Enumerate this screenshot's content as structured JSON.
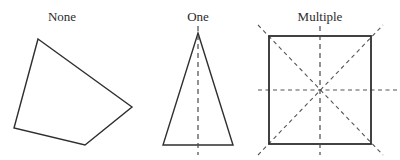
{
  "figure": {
    "background_color": "#ffffff",
    "stroke_color": "#2e2e2e",
    "symmetry_line_color": "#4a4a4a",
    "label_color": "#2b2b2b",
    "width": 400,
    "height": 160
  },
  "panels": [
    {
      "id": "none",
      "label": "None",
      "label_x": 62,
      "label_y": 21,
      "shape": "irregular-quadrilateral",
      "symmetry_line_count": 0,
      "symmetry_lines": [],
      "vertices": [
        {
          "x": 38,
          "y": 39
        },
        {
          "x": 132,
          "y": 107
        },
        {
          "x": 85,
          "y": 145
        },
        {
          "x": 14,
          "y": 128
        }
      ],
      "points_attr": "38,39 132,107 85,145 14,128"
    },
    {
      "id": "one",
      "label": "One",
      "label_x": 198,
      "label_y": 21,
      "shape": "isosceles-triangle",
      "symmetry_line_count": 1,
      "vertices": [
        {
          "x": 198,
          "y": 33
        },
        {
          "x": 233,
          "y": 145
        },
        {
          "x": 163,
          "y": 145
        }
      ],
      "points_attr": "198,33 233,145 163,145",
      "symmetry_lines": [
        {
          "name": "vertical-axis",
          "orientation": "vertical",
          "x1": 198,
          "y1": 26,
          "x2": 198,
          "y2": 155
        }
      ]
    },
    {
      "id": "multiple",
      "label": "Multiple",
      "label_x": 320,
      "label_y": 21,
      "shape": "square",
      "symmetry_line_count": 4,
      "square": {
        "x": 269,
        "y": 36,
        "width": 102,
        "height": 108
      },
      "symmetry_lines": [
        {
          "name": "vertical-axis",
          "orientation": "vertical",
          "x1": 320,
          "y1": 26,
          "x2": 320,
          "y2": 155
        },
        {
          "name": "horizontal-axis",
          "orientation": "horizontal",
          "x1": 258,
          "y1": 90,
          "x2": 397,
          "y2": 90
        },
        {
          "name": "diagonal-axis-tlbr",
          "orientation": "diagonal-down",
          "x1": 258,
          "y1": 25,
          "x2": 383,
          "y2": 155
        },
        {
          "name": "diagonal-axis-bltr",
          "orientation": "diagonal-up",
          "x1": 258,
          "y1": 155,
          "x2": 383,
          "y2": 25
        }
      ]
    }
  ]
}
